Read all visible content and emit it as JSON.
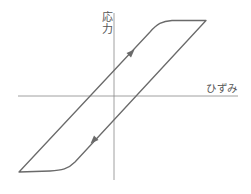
{
  "diagram": {
    "type": "stress-strain hysteresis loop",
    "y_axis_label_line1": "応",
    "y_axis_label_line2": "力",
    "x_axis_label": "ひずみ",
    "colors": {
      "axis": "#777777",
      "curve": "#6a6a6a",
      "text": "#555555",
      "background": "#ffffff"
    },
    "loop_direction": [
      "up along left branch",
      "down along right branch"
    ]
  }
}
